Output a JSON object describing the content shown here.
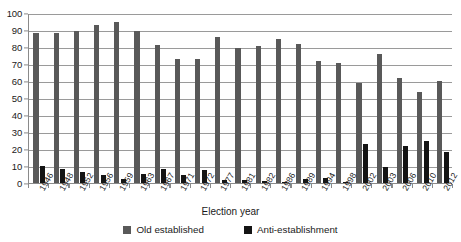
{
  "chart_data": {
    "type": "bar",
    "title": "",
    "subtitle": "",
    "xlabel": "Election year",
    "ylabel": "",
    "ylim": [
      0,
      100
    ],
    "yticks": [
      0,
      10,
      20,
      30,
      40,
      50,
      60,
      70,
      80,
      90,
      100
    ],
    "grid": true,
    "legend_position": "bottom",
    "categories": [
      "1946",
      "1948",
      "1952",
      "1956",
      "1959",
      "1963",
      "1967",
      "1971",
      "1972",
      "1977",
      "1981",
      "1982",
      "1986",
      "1989",
      "1994",
      "1998",
      "2002",
      "2003",
      "2006",
      "2010",
      "2012"
    ],
    "series": [
      {
        "name": "Old established",
        "color": "#595959",
        "values": [
          88,
          88.5,
          89.5,
          93,
          94.5,
          89.5,
          81,
          73,
          73,
          86,
          79.5,
          80.5,
          84.5,
          82,
          72,
          70.5,
          59,
          76,
          61.5,
          53.5,
          60
        ]
      },
      {
        "name": "Anti-establishment",
        "color": "#141414",
        "values": [
          10,
          8,
          6.5,
          5,
          2.5,
          5.5,
          8,
          5,
          7.5,
          2,
          1.5,
          1,
          0.5,
          2.5,
          3,
          0.5,
          23,
          9.5,
          21.5,
          25,
          18.5
        ]
      }
    ]
  },
  "axes": {
    "x_title": "Election year"
  },
  "legend": {
    "items": [
      {
        "label": "Old established",
        "swatch": "old"
      },
      {
        "label": "Anti-establishment",
        "swatch": "anti"
      }
    ]
  }
}
